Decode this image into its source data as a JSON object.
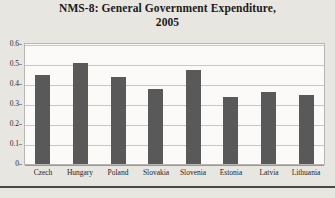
{
  "chart_data": {
    "type": "bar",
    "title": "NMS-8:  General Government Expenditure, 2005",
    "title_line1": "NMS-8:  General Government Expenditure,",
    "title_line2": "2005",
    "xlabel": "",
    "ylabel": "",
    "categories": [
      "Czech",
      "Hungary",
      "Poland",
      "Slovakia",
      "Slovenia",
      "Estonia",
      "Latvia",
      "Lithuania"
    ],
    "values": [
      0.445,
      0.505,
      0.437,
      0.375,
      0.47,
      0.335,
      0.36,
      0.345
    ],
    "ylim": [
      0,
      0.6
    ],
    "ytick_labels": [
      "0.6",
      "0.5",
      "0.4",
      "0.3",
      "0.2",
      "0.1",
      "0"
    ],
    "ytick_values": [
      0.6,
      0.5,
      0.4,
      0.3,
      0.2,
      0.1,
      0
    ],
    "grid": true,
    "legend": false,
    "legend_position": "none",
    "series": [
      {
        "name": "General Government Expenditure",
        "values": [
          0.445,
          0.505,
          0.437,
          0.375,
          0.47,
          0.335,
          0.36,
          0.345
        ]
      }
    ]
  },
  "colors": {
    "bar": "#595959",
    "plot_background": "#fbfaf8",
    "page_background": "#e8e6e1",
    "gridline": "#c9c7c3",
    "frame_border": "#b8b6b2",
    "title_text": "#1a1a1a",
    "axis_text": "#2b2b2b",
    "bottom_rule": "#4a4845"
  }
}
